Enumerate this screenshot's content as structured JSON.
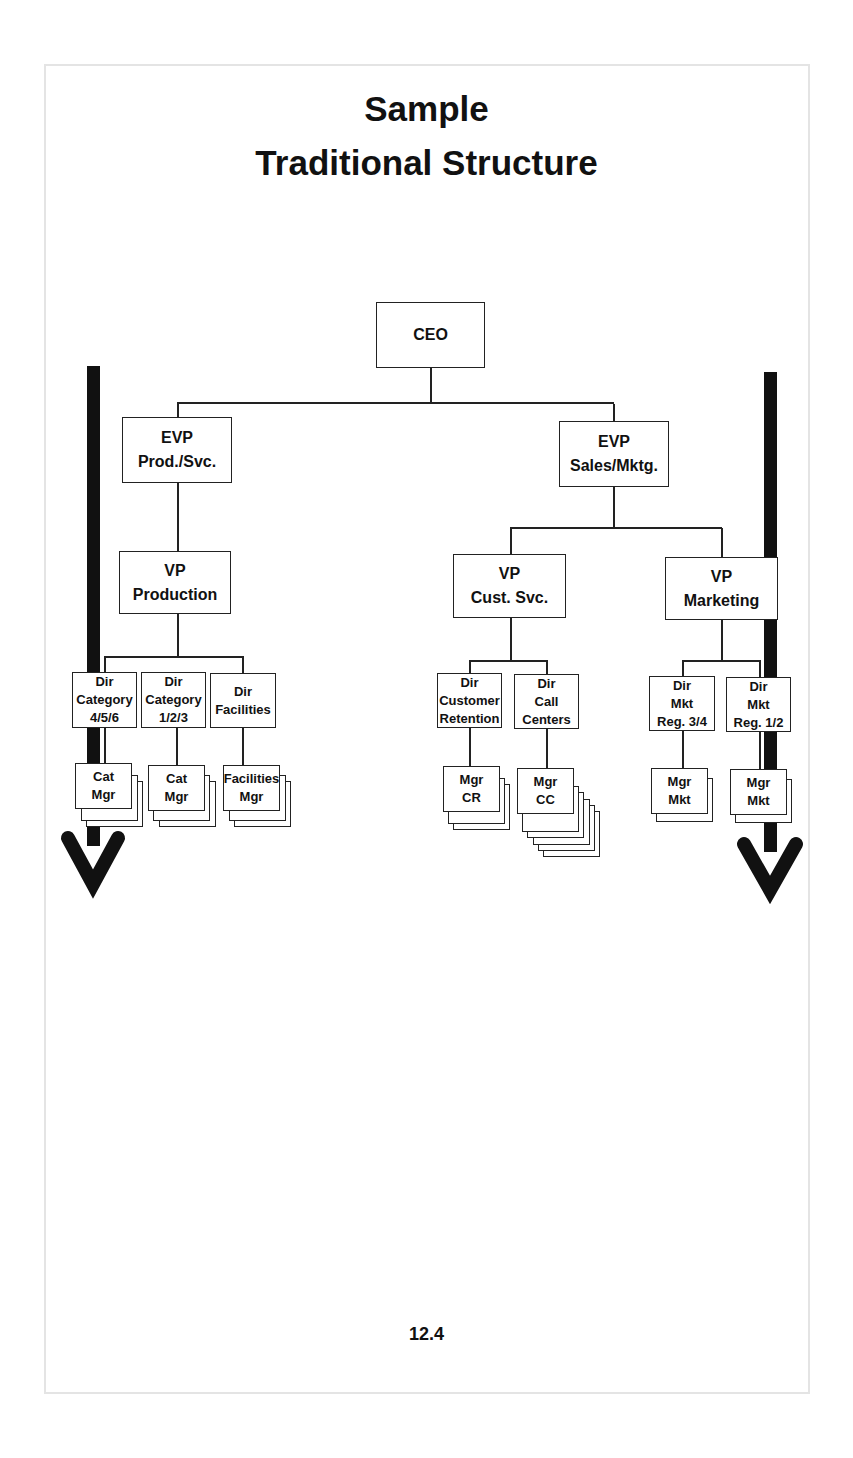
{
  "title": {
    "line1": "Sample",
    "line2": "Traditional Structure"
  },
  "page_number": "12.4",
  "org_chart": {
    "ceo": {
      "label": "CEO"
    },
    "evp_prod": {
      "line1": "EVP",
      "line2": "Prod./Svc."
    },
    "evp_sales": {
      "line1": "EVP",
      "line2": "Sales/Mktg."
    },
    "vp_production": {
      "line1": "VP",
      "line2": "Production"
    },
    "vp_cust_svc": {
      "line1": "VP",
      "line2": "Cust. Svc."
    },
    "vp_marketing": {
      "line1": "VP",
      "line2": "Marketing"
    },
    "directors": [
      {
        "line1": "Dir",
        "line2": "Category",
        "line3": "4/5/6"
      },
      {
        "line1": "Dir",
        "line2": "Category",
        "line3": "1/2/3"
      },
      {
        "line1": "Dir",
        "line2": "Facilities"
      },
      {
        "line1": "Dir",
        "line2": "Customer",
        "line3": "Retention"
      },
      {
        "line1": "Dir",
        "line2": "Call",
        "line3": "Centers"
      },
      {
        "line1": "Dir",
        "line2": "Mkt",
        "line3": "Reg. 3/4"
      },
      {
        "line1": "Dir",
        "line2": "Mkt",
        "line3": "Reg. 1/2"
      }
    ],
    "managers": [
      {
        "line1": "Cat",
        "line2": "Mgr",
        "stack_count": 3
      },
      {
        "line1": "Cat",
        "line2": "Mgr",
        "stack_count": 3
      },
      {
        "line1": "Facilities",
        "line2": "Mgr",
        "stack_count": 3
      },
      {
        "line1": "Mgr",
        "line2": "CR",
        "stack_count": 3
      },
      {
        "line1": "Mgr",
        "line2": "CC",
        "stack_count": 6
      },
      {
        "line1": "Mgr",
        "line2": "Mkt",
        "stack_count": 2
      },
      {
        "line1": "Mgr",
        "line2": "Mkt",
        "stack_count": 2
      }
    ]
  },
  "arrows": [
    {
      "side": "left",
      "direction": "down",
      "color": "#111111"
    },
    {
      "side": "right",
      "direction": "down",
      "color": "#111111"
    }
  ]
}
